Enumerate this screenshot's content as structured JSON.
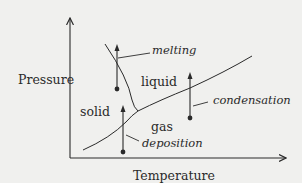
{
  "diagram": {
    "colors": {
      "background": "#f0f0ee",
      "ink": "#2a2a2a"
    },
    "axes": {
      "y_label": "Pressure",
      "x_label": "Temperature"
    },
    "regions": {
      "solid": "solid",
      "liquid": "liquid",
      "gas": "gas"
    },
    "processes": {
      "melting": "melting",
      "condensation": "condensation",
      "deposition": "deposition"
    },
    "boundaries": [
      {
        "name": "melting-curve",
        "between": [
          "solid",
          "liquid"
        ]
      },
      {
        "name": "vaporization-curve",
        "between": [
          "liquid",
          "gas"
        ]
      },
      {
        "name": "sublimation-curve",
        "between": [
          "solid",
          "gas"
        ]
      }
    ],
    "transitions": [
      {
        "name": "melting",
        "from": "solid",
        "to": "liquid",
        "direction": "up"
      },
      {
        "name": "condensation",
        "from": "gas",
        "to": "liquid",
        "direction": "up"
      },
      {
        "name": "deposition",
        "from": "gas",
        "to": "solid",
        "direction": "up"
      }
    ]
  }
}
